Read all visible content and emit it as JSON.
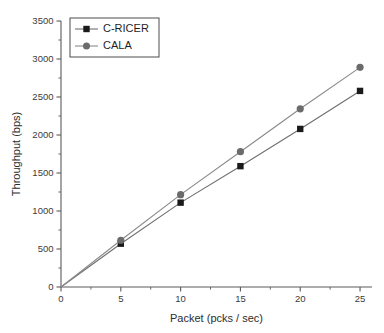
{
  "chart_data": {
    "type": "line",
    "title": "",
    "xlabel": "Packet (pcks / sec)",
    "ylabel": "Throughput (bps)",
    "xlim": [
      0,
      26
    ],
    "ylim": [
      0,
      3500
    ],
    "xticks": [
      0,
      5,
      10,
      15,
      20,
      25
    ],
    "yticks": [
      0,
      500,
      1000,
      1500,
      2000,
      2500,
      3000,
      3500
    ],
    "xtick_labels": [
      "0",
      "5",
      "10",
      "15",
      "20",
      "25"
    ],
    "ytick_labels": [
      "0",
      "500",
      "1000",
      "1500",
      "2000",
      "2500",
      "3000",
      "3500"
    ],
    "x_minor_step": 2.5,
    "y_minor_step": 250,
    "grid": false,
    "legend_position": "top-left",
    "x": [
      0,
      5,
      10,
      15,
      20,
      25
    ],
    "series": [
      {
        "name": "C-RICER",
        "values": [
          0,
          570,
          1110,
          1590,
          2080,
          2580
        ],
        "color": "#1a1a1a",
        "line_color": "#6f6f6f",
        "marker": "square"
      },
      {
        "name": "CALA",
        "values": [
          0,
          615,
          1215,
          1780,
          2345,
          2890
        ],
        "color": "#6b6b6b",
        "line_color": "#8a8a8a",
        "marker": "circle"
      }
    ]
  },
  "legend": {
    "entries": [
      {
        "label": "C-RICER"
      },
      {
        "label": "CALA"
      }
    ]
  },
  "axis_titles": {
    "x": "Packet (pcks / sec)",
    "y": "Throughput (bps)"
  }
}
